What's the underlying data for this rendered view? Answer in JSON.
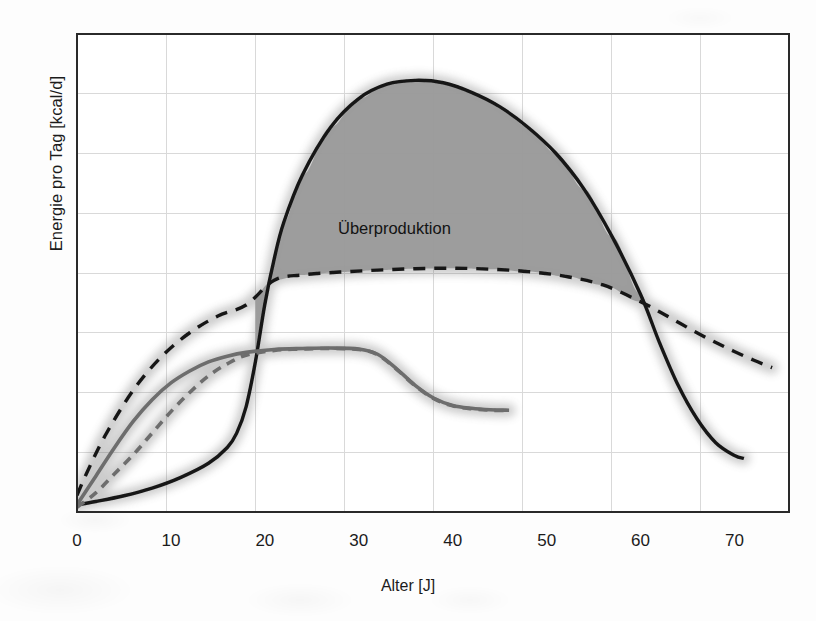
{
  "figure": {
    "kind": "scanned-line-chart",
    "background_color": "#fdfdfd",
    "plot_border_color": "#2a2a2a",
    "grid_color": "#d9d9d9",
    "fill_color": "#9a9a9a",
    "black_curve_color": "#161616",
    "gray_curve_color": "#6d6d6d"
  },
  "annotations": [
    {
      "name": "ueberproduktion",
      "text": "Überproduktion",
      "x_age": 33,
      "color": "#131313"
    }
  ],
  "axes": {
    "x": {
      "label": "Alter [J]",
      "ticks": [
        "0",
        "10",
        "20",
        "30",
        "40",
        "50",
        "60",
        "70"
      ],
      "tick_values": [
        0,
        10,
        20,
        30,
        40,
        50,
        60,
        70
      ],
      "min": 0,
      "max": 75.8
    },
    "y": {
      "label": "Energie pro Tag [kcal/d]",
      "ticks": [],
      "min": 0,
      "max": 100
    }
  },
  "chart_data": {
    "type": "line",
    "title": "",
    "xlabel": "Alter [J]",
    "ylabel": "Energie pro Tag [kcal/d]",
    "xlim": [
      0,
      75.8
    ],
    "ylim": [
      0,
      100
    ],
    "grid": true,
    "grid_columns": 8,
    "grid_rows": 8,
    "legend": "none",
    "fill_between": {
      "label": "Überproduktion",
      "upper_series": "Energieproduktion",
      "lower_series": "Energiebedarf",
      "x_from": 19,
      "x_to": 60.5,
      "color": "#9a9a9a"
    },
    "series": [
      {
        "name": "Energieproduktion",
        "style": "solid",
        "color": "#161616",
        "x": [
          0,
          2,
          5,
          8,
          11,
          14,
          16,
          17,
          18,
          19,
          20,
          21,
          22,
          24,
          27,
          30,
          33,
          36,
          39,
          42,
          45,
          48,
          51,
          54,
          57,
          60,
          62,
          64,
          66,
          68,
          70,
          71
        ],
        "y": [
          1.5,
          2.2,
          3.4,
          5.0,
          7.2,
          10.2,
          13.5,
          16.5,
          22.0,
          31.5,
          43.5,
          53.0,
          60.5,
          70.5,
          80.5,
          86.5,
          89.5,
          90.3,
          89.8,
          87.8,
          84.8,
          80.5,
          75.0,
          67.5,
          57.5,
          45.5,
          35.5,
          26.5,
          19.5,
          14.5,
          11.8,
          11.2
        ]
      },
      {
        "name": "Energiebedarf",
        "style": "dashed",
        "color": "#161616",
        "x": [
          0,
          1,
          3,
          6,
          9,
          12,
          15,
          18,
          21,
          24,
          28,
          32,
          36,
          40,
          44,
          48,
          52,
          56,
          60,
          63,
          66,
          69,
          72,
          74
        ],
        "y": [
          3.5,
          8.0,
          16.0,
          25.5,
          32.5,
          37.5,
          41.0,
          43.3,
          48.5,
          49.6,
          50.2,
          50.6,
          50.9,
          51.0,
          50.8,
          50.3,
          49.3,
          47.5,
          44.0,
          40.8,
          37.5,
          34.5,
          31.8,
          30.2
        ]
      },
      {
        "name": "Energieproduktion-Vergleich",
        "style": "solid",
        "color": "#6d6d6d",
        "x": [
          0,
          2,
          4,
          6,
          8,
          10,
          12,
          14,
          16,
          18,
          21,
          24,
          27,
          30,
          32,
          34,
          36,
          38,
          40,
          42,
          44,
          46
        ],
        "y": [
          1.5,
          7.5,
          13.5,
          19.0,
          23.5,
          27.0,
          29.5,
          31.4,
          32.6,
          33.4,
          34.0,
          34.2,
          34.3,
          34.1,
          33.0,
          30.0,
          26.5,
          23.8,
          22.3,
          21.7,
          21.4,
          21.3
        ]
      },
      {
        "name": "Energiebedarf-Vergleich",
        "style": "dashed",
        "color": "#6d6d6d",
        "x": [
          0,
          2,
          4,
          6,
          8,
          10,
          12,
          14,
          16,
          18,
          21,
          24,
          27,
          30,
          32,
          34,
          36,
          38,
          40,
          42,
          44,
          46
        ],
        "y": [
          1.0,
          4.0,
          8.0,
          12.0,
          16.5,
          21.0,
          25.0,
          28.5,
          31.0,
          32.8,
          33.8,
          34.1,
          34.2,
          34.0,
          32.9,
          29.9,
          26.4,
          23.7,
          22.2,
          21.6,
          21.3,
          21.2
        ]
      }
    ]
  }
}
